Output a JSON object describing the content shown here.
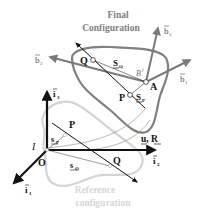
{
  "colors": {
    "final_body": "#808080",
    "reference_body": "#d4d4d4",
    "axis": "#111111",
    "body_frame_axis": "#7a7a7a",
    "text": "#111111",
    "title_text": "#808080",
    "reference_text": "#d6d6d6"
  },
  "final_configuration": {
    "title_line1": "Final",
    "title_line2": "Configuration",
    "body_label": "B",
    "body_label_sup": "f",
    "point_Q": "Q",
    "point_P": "P",
    "point_A": "A",
    "vector_S_Q": "S",
    "vector_S_Q_sub": "Q",
    "vector_S_P": "S",
    "vector_S_P_sub": "P",
    "frame": {
      "b1": "b",
      "b1_sub": "1",
      "b2": "b",
      "b2_sub": "2",
      "b3": "b",
      "b3_sub": "3"
    }
  },
  "reference_configuration": {
    "title_line1": "Reference",
    "title_line2": "configuration",
    "point_P": "P",
    "point_Q": "Q",
    "vector_s_P": "s",
    "vector_s_P_sub": "P",
    "vector_s_Q": "s",
    "vector_s_Q_sub": "Q"
  },
  "inertial_frame": {
    "frame_label": "I",
    "origin": "O",
    "i1": "i",
    "i1_sub": "1",
    "i2": "i",
    "i2_sub": "2",
    "i3": "i",
    "i3_sub": "3"
  },
  "displacement_label": {
    "u": "u",
    "separator": ", ",
    "R": "R"
  }
}
